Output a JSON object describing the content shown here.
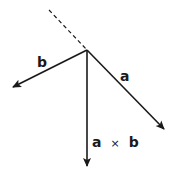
{
  "diagram": {
    "colors": {
      "stroke": "#1a1a1a",
      "background": "#ffffff"
    },
    "origin": {
      "x": 87,
      "y": 50
    },
    "extension_line": {
      "style": "dashed",
      "from": {
        "x": 49,
        "y": 10
      },
      "to": {
        "x": 87,
        "y": 50
      }
    },
    "vectors": [
      {
        "id": "a",
        "label": "a",
        "to": {
          "x": 164,
          "y": 129
        },
        "label_pos": {
          "x": 120,
          "y": 81
        }
      },
      {
        "id": "b",
        "label": "b",
        "to": {
          "x": 13,
          "y": 87
        },
        "label_pos": {
          "x": 37,
          "y": 67
        }
      },
      {
        "id": "axb",
        "label_a": "a",
        "label_op": "×",
        "label_b": "b",
        "to": {
          "x": 87,
          "y": 166
        },
        "label_pos": {
          "x": 92,
          "y": 147
        }
      }
    ]
  }
}
